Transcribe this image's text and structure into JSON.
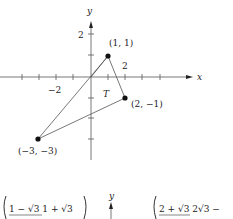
{
  "figure": {
    "axes": {
      "x_label": "x",
      "y_label": "y",
      "x_tick_label_neg": "−2",
      "x_tick_label_pos": "2",
      "y_tick_label_pos": "2"
    },
    "region_label": "T",
    "points": [
      {
        "label": "(1, 1)",
        "x": 1,
        "y": 1
      },
      {
        "label": "(2, −1)",
        "x": 2,
        "y": -1
      },
      {
        "label": "(−3, −3)",
        "x": -3,
        "y": -3
      }
    ]
  },
  "bottom": {
    "left_expr": "1 − √3   1 + √3",
    "axis_label": "y",
    "right_expr": "2 + √3   2√3 −"
  }
}
